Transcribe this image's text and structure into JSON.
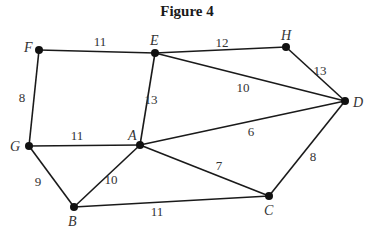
{
  "figure": {
    "title": "Figure 4"
  },
  "graph": {
    "nodes": [
      {
        "id": "F",
        "label": "F",
        "x": 39,
        "y": 50,
        "lx": 24,
        "ly": 52
      },
      {
        "id": "E",
        "label": "E",
        "x": 155,
        "y": 53,
        "lx": 150,
        "ly": 45
      },
      {
        "id": "H",
        "label": "H",
        "x": 286,
        "y": 47,
        "lx": 281,
        "ly": 40
      },
      {
        "id": "D",
        "label": "D",
        "x": 345,
        "y": 101,
        "lx": 353,
        "ly": 107
      },
      {
        "id": "G",
        "label": "G",
        "x": 29,
        "y": 146,
        "lx": 10,
        "ly": 151
      },
      {
        "id": "A",
        "label": "A",
        "x": 140,
        "y": 145,
        "lx": 128,
        "ly": 140
      },
      {
        "id": "B",
        "label": "B",
        "x": 74,
        "y": 207,
        "lx": 68,
        "ly": 226
      },
      {
        "id": "C",
        "label": "C",
        "x": 269,
        "y": 196,
        "lx": 264,
        "ly": 215
      }
    ],
    "edges": [
      {
        "from": "F",
        "to": "E",
        "weight": "11",
        "lx": 100,
        "ly": 46
      },
      {
        "from": "E",
        "to": "H",
        "weight": "12",
        "lx": 222,
        "ly": 47
      },
      {
        "from": "H",
        "to": "D",
        "weight": "13",
        "lx": 320,
        "ly": 75
      },
      {
        "from": "E",
        "to": "D",
        "weight": "10",
        "lx": 243,
        "ly": 92
      },
      {
        "from": "F",
        "to": "G",
        "weight": "8",
        "lx": 22,
        "ly": 102
      },
      {
        "from": "E",
        "to": "A",
        "weight": "13",
        "lx": 151,
        "ly": 104
      },
      {
        "from": "G",
        "to": "A",
        "weight": "11",
        "lx": 77,
        "ly": 140
      },
      {
        "from": "A",
        "to": "D",
        "weight": "6",
        "lx": 251,
        "ly": 136
      },
      {
        "from": "G",
        "to": "B",
        "weight": "9",
        "lx": 38,
        "ly": 186
      },
      {
        "from": "A",
        "to": "B",
        "weight": "10",
        "lx": 111,
        "ly": 184
      },
      {
        "from": "A",
        "to": "C",
        "weight": "7",
        "lx": 219,
        "ly": 170
      },
      {
        "from": "D",
        "to": "C",
        "weight": "8",
        "lx": 313,
        "ly": 161
      },
      {
        "from": "B",
        "to": "C",
        "weight": "11",
        "lx": 157,
        "ly": 216
      }
    ]
  },
  "colors": {
    "edge": "#1a1a1a",
    "node": "#111111",
    "text": "#333333"
  }
}
